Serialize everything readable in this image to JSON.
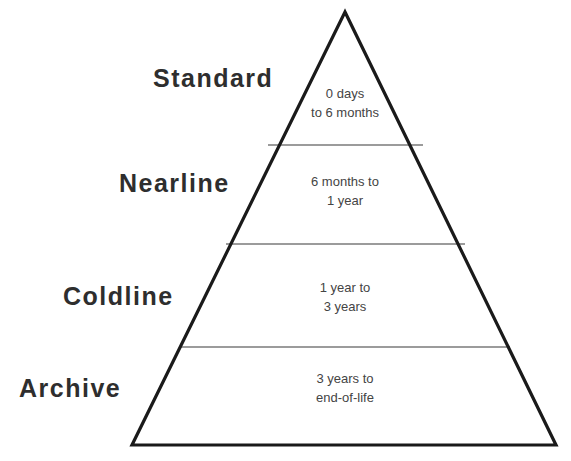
{
  "diagram": {
    "type": "pyramid",
    "colors": {
      "outline": "#1a1a1a",
      "divider": "#7a7a7a",
      "label_text": "#2e2e2e",
      "range_text": "#444444",
      "background": "#ffffff"
    },
    "tiers": [
      {
        "label": "Standard",
        "range_line1": "0 days",
        "range_line2": "to 6 months"
      },
      {
        "label": "Nearline",
        "range_line1": "6 months to",
        "range_line2": "1 year"
      },
      {
        "label": "Coldline",
        "range_line1": "1 year to",
        "range_line2": "3 years"
      },
      {
        "label": "Archive",
        "range_line1": "3 years to",
        "range_line2": "end-of-life"
      }
    ]
  }
}
